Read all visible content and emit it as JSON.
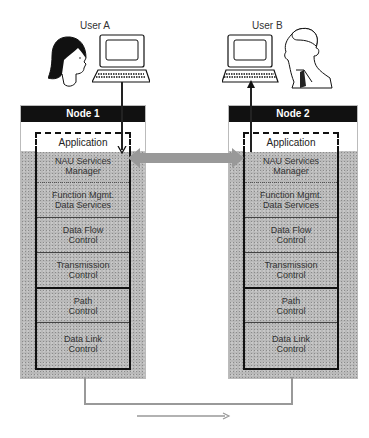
{
  "users": [
    {
      "label": "User A",
      "icon": "woman-user-icon"
    },
    {
      "label": "User B",
      "icon": "man-user-icon"
    }
  ],
  "nodes": [
    {
      "title": "Node 1",
      "application": "Application",
      "layers": [
        {
          "line1": "NAU Services",
          "line2": "Manager"
        },
        {
          "line1": "Function Mgmt.",
          "line2": "Data Services"
        },
        {
          "line1": "Data Flow",
          "line2": "Control"
        },
        {
          "line1": "Transmission",
          "line2": "Control"
        },
        {
          "line1": "Path",
          "line2": "Control"
        },
        {
          "line1": "Data Link",
          "line2": "Control"
        }
      ]
    },
    {
      "title": "Node 2",
      "application": "Application",
      "layers": [
        {
          "line1": "NAU Services",
          "line2": "Manager"
        },
        {
          "line1": "Function Mgmt.",
          "line2": "Data Services"
        },
        {
          "line1": "Data Flow",
          "line2": "Control"
        },
        {
          "line1": "Transmission",
          "line2": "Control"
        },
        {
          "line1": "Path",
          "line2": "Control"
        },
        {
          "line1": "Data Link",
          "line2": "Control"
        }
      ]
    }
  ],
  "connectors": {
    "peer_arrow": "double-headed gray arrow between Application layers",
    "physical_link": "gray link between the two nodes",
    "flow_arrow": "arrow pointing right"
  },
  "colors": {
    "header_bg": "#111111",
    "header_text": "#ffffff",
    "stipple_bg": "#b9b9b9",
    "arrow_gray": "#999999"
  }
}
